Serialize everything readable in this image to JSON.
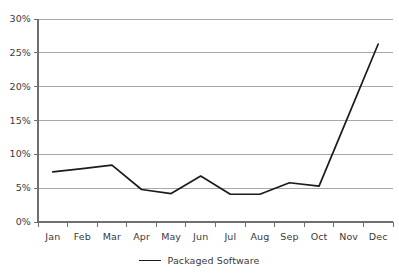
{
  "chart_data": {
    "type": "line",
    "title": "",
    "xlabel": "",
    "ylabel": "",
    "categories": [
      "Jan",
      "Feb",
      "Mar",
      "Apr",
      "May",
      "Jun",
      "Jul",
      "Aug",
      "Sep",
      "Oct",
      "Nov",
      "Dec"
    ],
    "series": [
      {
        "name": "Packaged Software",
        "color": "#1c1c1c",
        "values": [
          7.4,
          7.9,
          8.4,
          4.8,
          4.2,
          6.8,
          4.1,
          4.1,
          5.8,
          5.3,
          15.8,
          26.3
        ]
      }
    ],
    "ytick_labels": [
      "0%",
      "5%",
      "10%",
      "15%",
      "20%",
      "25%",
      "30%"
    ],
    "ytick_values": [
      0,
      5,
      10,
      15,
      20,
      25,
      30
    ],
    "ylim": [
      0,
      30
    ],
    "yunit": "%",
    "grid": true,
    "grid_axis": "y",
    "legend_position": "bottom",
    "legend": [
      {
        "label": "Packaged Software",
        "marker": "line"
      }
    ],
    "colors": {
      "line": "#1c1c1c",
      "gridline": "#a8a8a8",
      "axis": "#6f6f6f",
      "text": "#3a3a3a",
      "background": "#ffffff"
    }
  },
  "cropped_header": {
    "left_fragment": "",
    "right_fragment": ""
  }
}
